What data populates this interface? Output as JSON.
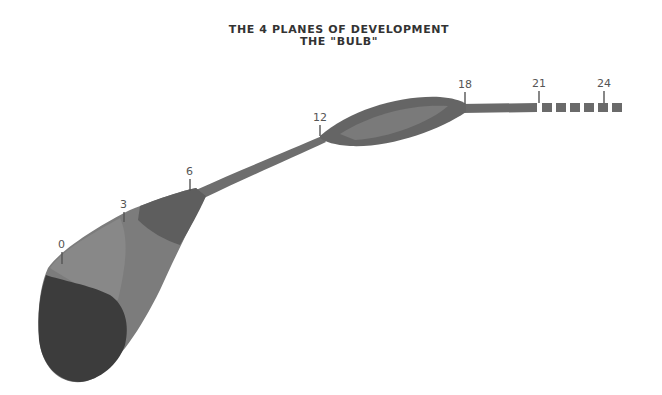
{
  "title": {
    "line1": "THE 4 PLANES OF DEVELOPMENT",
    "line2": "THE  \"BULB\""
  },
  "markers": [
    {
      "label": "0"
    },
    {
      "label": "3"
    },
    {
      "label": "6"
    },
    {
      "label": "12"
    },
    {
      "label": "18"
    },
    {
      "label": "21"
    },
    {
      "label": "24"
    }
  ],
  "colors": {
    "darkest": "#3a3a3a",
    "dark": "#5a5a5a",
    "mid": "#7a7a7a",
    "light": "#8c8c8c",
    "stroke": "#555555",
    "text": "#333333"
  }
}
